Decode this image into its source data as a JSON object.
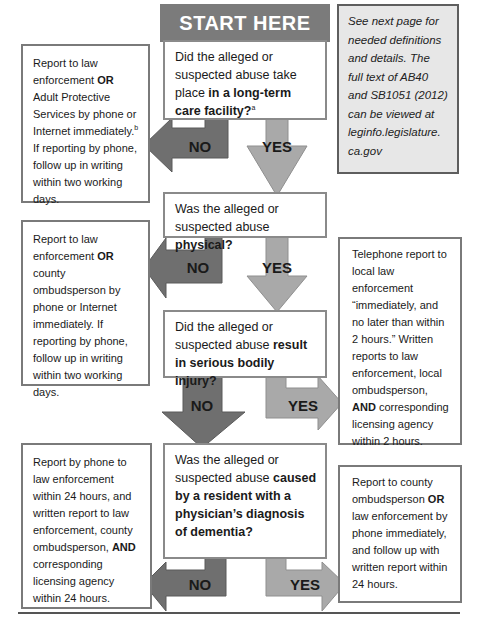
{
  "header": {
    "start_label": "START HERE"
  },
  "note": {
    "text": "See next page for needed definitions and details. The full text of AB40 and SB1051 (2012) can be viewed at leginfo.legislature.ca.gov",
    "line1": "See next page for",
    "line2": "needed definitions",
    "line3": "and details. The",
    "line4": "full text of AB40",
    "line5": "and SB1051 (2012)",
    "line6": "can be viewed at",
    "line7": "leginfo.legislature.",
    "line8": "ca.gov"
  },
  "questions": [
    {
      "pre": "Did the alleged or suspected abuse take place ",
      "bold": "in a long-term care facility?",
      "sup": "a",
      "yes_label": "YES",
      "no_label": "NO"
    },
    {
      "pre": "Was the alleged or suspected abuse ",
      "bold": "physical?",
      "yes_label": "YES",
      "no_label": "NO"
    },
    {
      "pre": "Did the alleged or suspected abuse ",
      "bold": "result in serious bodily injury?",
      "yes_label": "YES",
      "no_label": "NO"
    },
    {
      "pre": "Was the alleged or suspected abuse ",
      "bold": "caused by a resident with a physician’s diagnosis of dementia?",
      "yes_label": "YES",
      "no_label": "NO"
    }
  ],
  "outcomes": {
    "not_ltc": {
      "pre": "Report to law enforcement ",
      "bold": "OR",
      "mid": " Adult Protective Services by phone or Internet immediately.",
      "sup": "b",
      "post": " If reporting by phone, follow up in writing within two working days."
    },
    "not_physical": {
      "pre": "Report to law enforcement ",
      "bold": "OR",
      "post": " county ombudsperson by phone or Internet immediately. If reporting by phone, follow up in writing within two working days."
    },
    "serious_injury": {
      "pre": "Telephone report to local law enforcement “immediately, and no later than within 2 hours.” Written reports to law enforcement, local ombudsperson, ",
      "bold": "AND",
      "post": " corresponding licensing agency within 2 hours."
    },
    "not_dementia": {
      "pre": "Report by phone to law enforcement within 24 hours, and written report to law enforcement, county ombudsperson, ",
      "bold": "AND",
      "post": " corresponding licensing agency within 24 hours."
    },
    "dementia": {
      "pre": "Report to county ombudsperson ",
      "bold": "OR",
      "post": " law enforcement by phone immediately, and follow up with written report within 24 hours."
    }
  },
  "colors": {
    "no_arrow": "#6f6f6f",
    "yes_arrow": "#a9a9a9",
    "start_bg": "#7b7b7b",
    "note_bg": "#e7e7e7",
    "box_border": "#7a7a7a"
  }
}
